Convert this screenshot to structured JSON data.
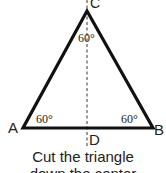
{
  "diagram": {
    "vertices": {
      "A": {
        "label": "A",
        "x": 23,
        "y": 128
      },
      "B": {
        "label": "B",
        "x": 153,
        "y": 128
      },
      "C": {
        "label": "C",
        "x": 87,
        "y": 11
      },
      "D": {
        "label": "D",
        "x": 87,
        "y": 128
      }
    },
    "angles": {
      "A": "60°",
      "B": "60°",
      "C": "60°"
    },
    "caption": {
      "line1": "Cut the triangle",
      "line2": "down the center"
    },
    "colors": {
      "stroke": "#111111",
      "dashed": "#555555",
      "text": "#222222"
    }
  }
}
